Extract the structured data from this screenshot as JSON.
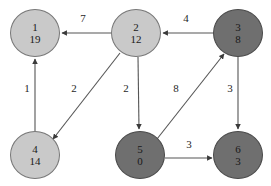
{
  "diagram": {
    "type": "directed-weighted-graph",
    "width": 271,
    "height": 186,
    "background_color": "#ffffff",
    "colors": {
      "node_unvisited_fill": "#c9c9c9",
      "node_visited_fill": "#6f6f6f",
      "node_stroke": "#777777",
      "edge_stroke": "#555555",
      "label_text": "#1f1f1f"
    }
  },
  "nodes": [
    {
      "id": "1",
      "distance": "19",
      "cx": 35,
      "cy": 33,
      "rx": 25,
      "ry": 24,
      "state": "unvisited"
    },
    {
      "id": "2",
      "distance": "12",
      "cx": 136,
      "cy": 33,
      "rx": 25,
      "ry": 24,
      "state": "unvisited"
    },
    {
      "id": "3",
      "distance": "8",
      "cx": 238,
      "cy": 33,
      "rx": 25,
      "ry": 24,
      "state": "visited"
    },
    {
      "id": "4",
      "distance": "14",
      "cx": 35,
      "cy": 155,
      "rx": 25,
      "ry": 24,
      "state": "unvisited"
    },
    {
      "id": "5",
      "distance": "0",
      "cx": 140,
      "cy": 155,
      "rx": 25,
      "ry": 24,
      "state": "visited"
    },
    {
      "id": "6",
      "distance": "3",
      "cx": 238,
      "cy": 155,
      "rx": 25,
      "ry": 24,
      "state": "visited"
    }
  ],
  "edges": [
    {
      "from": "2",
      "to": "1",
      "weight": "7",
      "label_x": 83,
      "label_y": 18,
      "x1": 111,
      "y1": 33,
      "x2": 62,
      "y2": 33
    },
    {
      "from": "3",
      "to": "2",
      "weight": "4",
      "label_x": 186,
      "label_y": 18,
      "x1": 213,
      "y1": 33,
      "x2": 163,
      "y2": 33
    },
    {
      "from": "4",
      "to": "1",
      "weight": "1",
      "label_x": 27,
      "label_y": 88,
      "x1": 35,
      "y1": 131,
      "x2": 35,
      "y2": 59
    },
    {
      "from": "2",
      "to": "4",
      "weight": "2",
      "label_x": 74,
      "label_y": 88,
      "x1": 120,
      "y1": 53,
      "x2": 53,
      "y2": 139
    },
    {
      "from": "2",
      "to": "5",
      "weight": "2",
      "label_x": 126,
      "label_y": 88,
      "x1": 138,
      "y1": 57,
      "x2": 139,
      "y2": 129
    },
    {
      "from": "5",
      "to": "3",
      "weight": "8",
      "label_x": 176,
      "label_y": 88,
      "x1": 157,
      "y1": 139,
      "x2": 224,
      "y2": 54
    },
    {
      "from": "3",
      "to": "6",
      "weight": "3",
      "label_x": 230,
      "label_y": 88,
      "x1": 238,
      "y1": 57,
      "x2": 238,
      "y2": 129
    },
    {
      "from": "5",
      "to": "6",
      "weight": "3",
      "label_x": 189,
      "label_y": 144,
      "x1": 165,
      "y1": 158,
      "x2": 212,
      "y2": 158
    }
  ]
}
